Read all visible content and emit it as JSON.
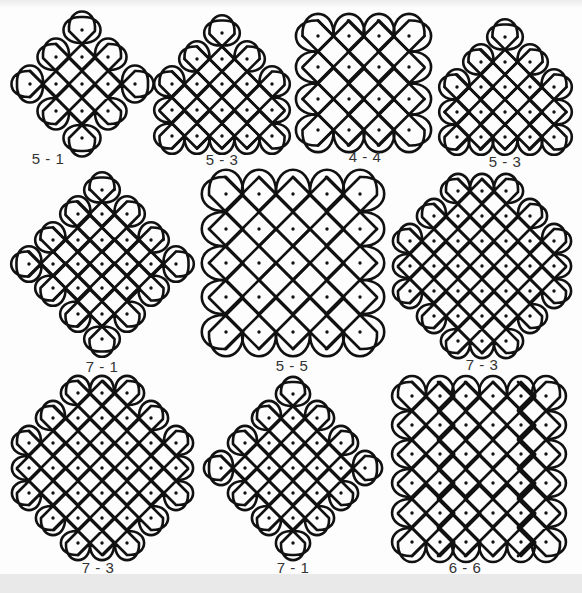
{
  "page": {
    "stroke_color": "#111111",
    "dot_color": "#111111",
    "background": "#ffffff"
  },
  "patterns": [
    {
      "id": "p1",
      "label": "5 - 1",
      "label_pos": [
        48,
        160
      ],
      "pitch": 26,
      "dots": [
        [
          82,
          30
        ],
        [
          56,
          57
        ],
        [
          82,
          57
        ],
        [
          108,
          57
        ],
        [
          30,
          84
        ],
        [
          56,
          84
        ],
        [
          82,
          84
        ],
        [
          108,
          84
        ],
        [
          135,
          84
        ],
        [
          56,
          111
        ],
        [
          82,
          111
        ],
        [
          108,
          111
        ],
        [
          82,
          138
        ]
      ]
    },
    {
      "id": "p2",
      "label": "5 - 3",
      "label_pos": [
        222,
        161
      ],
      "pitch": 25,
      "dots": [
        [
          222,
          33
        ],
        [
          197,
          59
        ],
        [
          222,
          59
        ],
        [
          247,
          59
        ],
        [
          172,
          84
        ],
        [
          197,
          84
        ],
        [
          222,
          84
        ],
        [
          247,
          84
        ],
        [
          272,
          84
        ],
        [
          172,
          110
        ],
        [
          197,
          110
        ],
        [
          222,
          110
        ],
        [
          247,
          110
        ],
        [
          272,
          110
        ],
        [
          172,
          136
        ],
        [
          197,
          136
        ],
        [
          222,
          136
        ],
        [
          247,
          136
        ],
        [
          272,
          136
        ]
      ]
    },
    {
      "id": "p3",
      "label": "4 - 4",
      "label_pos": [
        365,
        158
      ],
      "pitch": 31,
      "dots": [
        [
          318,
          36
        ],
        [
          349,
          36
        ],
        [
          379,
          36
        ],
        [
          409,
          36
        ],
        [
          318,
          67
        ],
        [
          349,
          67
        ],
        [
          379,
          67
        ],
        [
          409,
          67
        ],
        [
          318,
          99
        ],
        [
          349,
          99
        ],
        [
          379,
          99
        ],
        [
          409,
          99
        ],
        [
          318,
          130
        ],
        [
          349,
          130
        ],
        [
          379,
          130
        ],
        [
          409,
          130
        ]
      ]
    },
    {
      "id": "p4",
      "label": "5 - 3",
      "label_pos": [
        505,
        163
      ],
      "pitch": 25,
      "dots": [
        [
          505,
          37
        ],
        [
          481,
          62
        ],
        [
          505,
          62
        ],
        [
          530,
          62
        ],
        [
          457,
          87
        ],
        [
          481,
          87
        ],
        [
          505,
          87
        ],
        [
          530,
          87
        ],
        [
          554,
          87
        ],
        [
          457,
          112
        ],
        [
          481,
          112
        ],
        [
          505,
          112
        ],
        [
          530,
          112
        ],
        [
          554,
          112
        ],
        [
          457,
          137
        ],
        [
          481,
          137
        ],
        [
          505,
          137
        ],
        [
          530,
          137
        ],
        [
          554,
          137
        ]
      ]
    },
    {
      "id": "p5",
      "label": "7 - 1",
      "label_pos": [
        102,
        368
      ],
      "pitch": 25,
      "dots": [
        [
          102,
          190
        ],
        [
          78,
          214
        ],
        [
          102,
          214
        ],
        [
          127,
          214
        ],
        [
          53,
          240
        ],
        [
          78,
          240
        ],
        [
          102,
          240
        ],
        [
          127,
          240
        ],
        [
          151,
          240
        ],
        [
          29,
          264
        ],
        [
          53,
          264
        ],
        [
          78,
          264
        ],
        [
          102,
          264
        ],
        [
          127,
          264
        ],
        [
          151,
          264
        ],
        [
          176,
          264
        ],
        [
          53,
          288
        ],
        [
          78,
          288
        ],
        [
          102,
          288
        ],
        [
          127,
          288
        ],
        [
          151,
          288
        ],
        [
          78,
          314
        ],
        [
          102,
          314
        ],
        [
          127,
          314
        ],
        [
          102,
          339
        ]
      ]
    },
    {
      "id": "p6",
      "label": "5 - 5",
      "label_pos": [
        292,
        367
      ],
      "pitch": 34,
      "dots": [
        [
          226,
          194
        ],
        [
          259,
          194
        ],
        [
          293,
          194
        ],
        [
          327,
          194
        ],
        [
          360,
          194
        ],
        [
          226,
          229
        ],
        [
          259,
          229
        ],
        [
          293,
          229
        ],
        [
          327,
          229
        ],
        [
          360,
          229
        ],
        [
          226,
          263
        ],
        [
          259,
          263
        ],
        [
          293,
          263
        ],
        [
          327,
          263
        ],
        [
          360,
          263
        ],
        [
          226,
          297
        ],
        [
          259,
          297
        ],
        [
          293,
          297
        ],
        [
          327,
          297
        ],
        [
          360,
          297
        ],
        [
          226,
          332
        ],
        [
          259,
          332
        ],
        [
          293,
          332
        ],
        [
          327,
          332
        ],
        [
          360,
          332
        ]
      ]
    },
    {
      "id": "p7",
      "label": "7 - 3",
      "label_pos": [
        482,
        366
      ],
      "pitch": 24,
      "dots": [
        [
          458,
          191
        ],
        [
          482,
          191
        ],
        [
          506,
          191
        ],
        [
          434,
          216
        ],
        [
          458,
          216
        ],
        [
          482,
          216
        ],
        [
          506,
          216
        ],
        [
          530,
          216
        ],
        [
          410,
          241
        ],
        [
          434,
          241
        ],
        [
          458,
          241
        ],
        [
          482,
          241
        ],
        [
          506,
          241
        ],
        [
          530,
          241
        ],
        [
          554,
          241
        ],
        [
          410,
          266
        ],
        [
          434,
          266
        ],
        [
          458,
          266
        ],
        [
          482,
          266
        ],
        [
          506,
          266
        ],
        [
          530,
          266
        ],
        [
          554,
          266
        ],
        [
          410,
          291
        ],
        [
          434,
          291
        ],
        [
          458,
          291
        ],
        [
          482,
          291
        ],
        [
          506,
          291
        ],
        [
          530,
          291
        ],
        [
          554,
          291
        ],
        [
          434,
          316
        ],
        [
          458,
          316
        ],
        [
          482,
          316
        ],
        [
          506,
          316
        ],
        [
          530,
          316
        ],
        [
          458,
          341
        ],
        [
          482,
          341
        ],
        [
          506,
          341
        ]
      ]
    },
    {
      "id": "p8",
      "label": "7 - 3",
      "label_pos": [
        98,
        569
      ],
      "pitch": 24,
      "dots": [
        [
          78,
          393
        ],
        [
          102,
          393
        ],
        [
          127,
          393
        ],
        [
          53,
          418
        ],
        [
          78,
          418
        ],
        [
          102,
          418
        ],
        [
          127,
          418
        ],
        [
          151,
          418
        ],
        [
          29,
          443
        ],
        [
          53,
          443
        ],
        [
          78,
          443
        ],
        [
          102,
          443
        ],
        [
          127,
          443
        ],
        [
          151,
          443
        ],
        [
          176,
          443
        ],
        [
          29,
          468
        ],
        [
          53,
          468
        ],
        [
          78,
          468
        ],
        [
          102,
          468
        ],
        [
          127,
          468
        ],
        [
          151,
          468
        ],
        [
          176,
          468
        ],
        [
          29,
          493
        ],
        [
          53,
          493
        ],
        [
          78,
          493
        ],
        [
          102,
          493
        ],
        [
          127,
          493
        ],
        [
          151,
          493
        ],
        [
          176,
          493
        ],
        [
          53,
          518
        ],
        [
          78,
          518
        ],
        [
          102,
          518
        ],
        [
          127,
          518
        ],
        [
          151,
          518
        ],
        [
          78,
          543
        ],
        [
          102,
          543
        ],
        [
          127,
          543
        ]
      ]
    },
    {
      "id": "p9",
      "label": "7 - 1",
      "label_pos": [
        293,
        569
      ],
      "pitch": 24,
      "dots": [
        [
          293,
          394
        ],
        [
          269,
          418
        ],
        [
          293,
          418
        ],
        [
          317,
          418
        ],
        [
          245,
          443
        ],
        [
          269,
          443
        ],
        [
          293,
          443
        ],
        [
          317,
          443
        ],
        [
          341,
          443
        ],
        [
          221,
          468
        ],
        [
          245,
          468
        ],
        [
          269,
          468
        ],
        [
          293,
          468
        ],
        [
          317,
          468
        ],
        [
          341,
          468
        ],
        [
          365,
          468
        ],
        [
          245,
          493
        ],
        [
          269,
          493
        ],
        [
          293,
          493
        ],
        [
          317,
          493
        ],
        [
          341,
          493
        ],
        [
          269,
          518
        ],
        [
          293,
          518
        ],
        [
          317,
          518
        ],
        [
          293,
          543
        ]
      ]
    },
    {
      "id": "p10",
      "label": "6 - 6",
      "label_pos": [
        465,
        569
      ],
      "pitch": 28,
      "dots": [
        [
          412,
          396
        ],
        [
          440,
          396
        ],
        [
          466,
          396
        ],
        [
          493,
          396
        ],
        [
          521,
          396
        ],
        [
          546,
          396
        ],
        [
          412,
          425
        ],
        [
          440,
          425
        ],
        [
          466,
          425
        ],
        [
          493,
          425
        ],
        [
          521,
          425
        ],
        [
          546,
          425
        ],
        [
          412,
          454
        ],
        [
          440,
          454
        ],
        [
          466,
          454
        ],
        [
          493,
          454
        ],
        [
          521,
          454
        ],
        [
          546,
          454
        ],
        [
          412,
          483
        ],
        [
          440,
          483
        ],
        [
          466,
          483
        ],
        [
          493,
          483
        ],
        [
          521,
          483
        ],
        [
          546,
          483
        ],
        [
          412,
          513
        ],
        [
          440,
          513
        ],
        [
          466,
          513
        ],
        [
          493,
          513
        ],
        [
          521,
          513
        ],
        [
          546,
          513
        ],
        [
          412,
          542
        ],
        [
          440,
          542
        ],
        [
          466,
          542
        ],
        [
          493,
          542
        ],
        [
          521,
          542
        ],
        [
          546,
          542
        ]
      ]
    }
  ]
}
